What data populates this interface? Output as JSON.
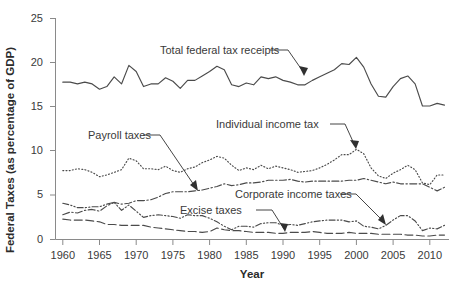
{
  "chart_data": {
    "type": "line",
    "title": "",
    "xlabel": "Year",
    "ylabel": "Federal Taxes (as percentage of GDP)",
    "xlim": [
      1959,
      2013
    ],
    "ylim": [
      0,
      25
    ],
    "yticks": [
      0,
      5,
      10,
      15,
      20,
      25
    ],
    "xticks": [
      1960,
      1965,
      1970,
      1975,
      1980,
      1985,
      1990,
      1995,
      2000,
      2005,
      2010
    ],
    "grid": false,
    "legend_position": "inline-annotations",
    "x": [
      1960,
      1961,
      1962,
      1963,
      1964,
      1965,
      1966,
      1967,
      1968,
      1969,
      1970,
      1971,
      1972,
      1973,
      1974,
      1975,
      1976,
      1977,
      1978,
      1979,
      1980,
      1981,
      1982,
      1983,
      1984,
      1985,
      1986,
      1987,
      1988,
      1989,
      1990,
      1991,
      1992,
      1993,
      1994,
      1995,
      1996,
      1997,
      1998,
      1999,
      2000,
      2001,
      2002,
      2003,
      2004,
      2005,
      2006,
      2007,
      2008,
      2009,
      2010,
      2011,
      2012
    ],
    "series": [
      {
        "name": "Total federal tax receipts",
        "style": "solid",
        "color": "#4b4b4b",
        "values": [
          17.8,
          17.8,
          17.6,
          17.8,
          17.6,
          17.0,
          17.3,
          18.4,
          17.6,
          19.7,
          19.0,
          17.3,
          17.6,
          17.6,
          18.3,
          17.9,
          17.1,
          18.0,
          18.0,
          18.5,
          19.0,
          19.6,
          19.2,
          17.5,
          17.3,
          17.7,
          17.5,
          18.4,
          18.2,
          18.4,
          18.0,
          17.8,
          17.5,
          17.5,
          18.0,
          18.4,
          18.8,
          19.2,
          19.9,
          19.8,
          20.6,
          19.5,
          17.6,
          16.2,
          16.1,
          17.3,
          18.2,
          18.5,
          17.6,
          15.1,
          15.1,
          15.4,
          15.2
        ]
      },
      {
        "name": "Individual income tax",
        "style": "dotted",
        "color": "#4b4b4b",
        "values": [
          7.8,
          7.8,
          8.0,
          7.9,
          7.6,
          7.1,
          7.3,
          7.6,
          7.9,
          9.2,
          8.9,
          8.0,
          8.0,
          7.9,
          8.3,
          7.8,
          7.6,
          8.0,
          8.2,
          8.7,
          9.0,
          9.4,
          9.2,
          8.4,
          7.8,
          8.1,
          7.9,
          8.4,
          8.0,
          8.3,
          8.1,
          7.9,
          7.6,
          7.7,
          7.8,
          8.1,
          8.5,
          9.0,
          9.6,
          9.6,
          10.2,
          9.7,
          8.1,
          7.2,
          6.9,
          7.5,
          7.9,
          8.4,
          7.9,
          6.4,
          6.2,
          7.3,
          7.3
        ]
      },
      {
        "name": "Payroll taxes",
        "style": "dashdot",
        "color": "#4b4b4b",
        "values": [
          2.8,
          3.1,
          3.0,
          3.3,
          3.4,
          3.2,
          3.8,
          4.2,
          4.0,
          4.1,
          4.4,
          4.4,
          4.5,
          4.8,
          5.2,
          5.4,
          5.4,
          5.4,
          5.5,
          5.6,
          5.8,
          6.0,
          6.3,
          6.1,
          6.2,
          6.4,
          6.4,
          6.5,
          6.7,
          6.7,
          6.7,
          6.8,
          6.6,
          6.5,
          6.6,
          6.6,
          6.6,
          6.6,
          6.6,
          6.7,
          6.7,
          6.9,
          6.7,
          6.5,
          6.3,
          6.5,
          6.3,
          6.3,
          6.3,
          6.3,
          5.9,
          5.5,
          5.9
        ]
      },
      {
        "name": "Corporate income taxes",
        "style": "dashdotdot",
        "color": "#4b4b4b",
        "values": [
          4.1,
          3.9,
          3.6,
          3.6,
          3.7,
          3.7,
          4.0,
          4.2,
          3.3,
          3.9,
          3.2,
          2.5,
          2.7,
          2.8,
          2.7,
          2.6,
          2.4,
          2.8,
          2.7,
          2.7,
          2.4,
          2.0,
          1.5,
          1.1,
          1.5,
          1.5,
          1.4,
          1.8,
          1.9,
          1.9,
          1.6,
          1.7,
          1.6,
          1.8,
          2.0,
          2.1,
          2.2,
          2.2,
          2.2,
          2.0,
          2.1,
          1.5,
          1.4,
          1.2,
          1.6,
          2.2,
          2.7,
          2.7,
          2.1,
          1.0,
          1.3,
          1.2,
          1.6
        ]
      },
      {
        "name": "Excise taxes",
        "style": "longdash",
        "color": "#4b4b4b",
        "values": [
          2.3,
          2.2,
          2.2,
          2.2,
          2.1,
          2.0,
          1.7,
          1.7,
          1.6,
          1.6,
          1.6,
          1.6,
          1.4,
          1.3,
          1.2,
          1.1,
          1.0,
          0.9,
          0.9,
          0.8,
          0.9,
          1.3,
          1.1,
          1.0,
          1.0,
          0.9,
          0.8,
          0.8,
          0.8,
          0.7,
          0.7,
          0.8,
          0.8,
          0.8,
          0.9,
          0.8,
          0.7,
          0.7,
          0.7,
          0.8,
          0.7,
          0.7,
          0.7,
          0.6,
          0.6,
          0.6,
          0.6,
          0.5,
          0.5,
          0.4,
          0.4,
          0.5,
          0.5
        ]
      }
    ],
    "annotations": [
      {
        "text": "Total federal tax receipts",
        "target_year": 1986,
        "target_value": 17.6
      },
      {
        "text": "Individual income tax",
        "target_year": 1999,
        "target_value": 9.6
      },
      {
        "text": "Payroll taxes",
        "target_year": 1981,
        "target_value": 6.0
      },
      {
        "text": "Corporate income taxes",
        "target_year": 2004,
        "target_value": 1.6
      },
      {
        "text": "Excise taxes",
        "target_year": 1990,
        "target_value": 0.7
      }
    ]
  },
  "axis": {
    "y_title": "Federal Taxes (as percentage of GDP)",
    "x_title": "Year",
    "y_tick_labels": [
      "0",
      "5",
      "10",
      "15",
      "20",
      "25"
    ],
    "x_tick_labels": [
      "1960",
      "1965",
      "1970",
      "1975",
      "1980",
      "1985",
      "1990",
      "1995",
      "2000",
      "2005",
      "2010"
    ]
  },
  "labels": {
    "total": "Total federal tax receipts",
    "individual": "Individual income tax",
    "payroll": "Payroll taxes",
    "corporate": "Corporate income taxes",
    "excise": "Excise taxes"
  }
}
